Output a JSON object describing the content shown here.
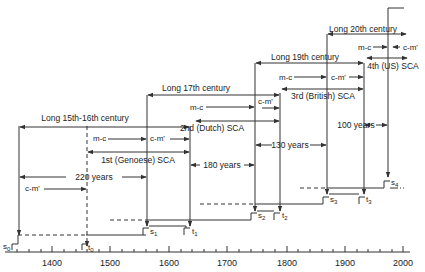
{
  "diagram": {
    "axis": {
      "ticks": [
        "1400",
        "1500",
        "1600",
        "1700",
        "1800",
        "1900",
        "2000"
      ]
    },
    "cycles": [
      {
        "century_label": "Long 15th-16th century",
        "sca_label": "1st (Genoese) SCA",
        "mc_label": "m-c",
        "cmprime_label": "c-m'",
        "duration_label": "220 years",
        "pre_label": "c-m'",
        "s_label": "s0",
        "t_label": "t0"
      },
      {
        "century_label": "Long 17th century",
        "sca_label": "2nd (Dutch) SCA",
        "mc_label": "m-c",
        "cmprime_label": "c-m'",
        "duration_label": "180 years",
        "s_label": "s1",
        "t_label": "t1"
      },
      {
        "century_label": "Long 19th century",
        "sca_label": "3rd (British) SCA",
        "mc_label": "m-c",
        "cmprime_label": "c-m'",
        "duration_label": "130 years",
        "s_label": "s2",
        "t_label": "t2"
      },
      {
        "century_label": "Long 20th century",
        "sca_label": "4th (US) SCA",
        "mc_label": "m-c",
        "cmprime_label": "c-m'",
        "duration_label": "100 years",
        "s_label": "s3",
        "t_label": "t3"
      }
    ],
    "extra_markers": {
      "s4": "s4"
    },
    "sub_letters": {
      "s": "s",
      "t": "t"
    },
    "subscripts": [
      "0",
      "1",
      "2",
      "3",
      "4"
    ]
  }
}
